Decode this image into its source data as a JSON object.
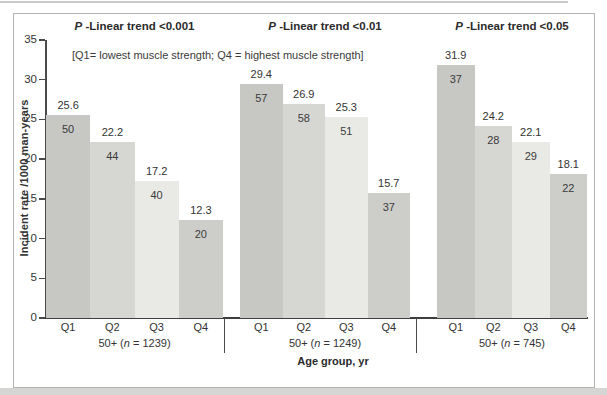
{
  "figure": {
    "subtitle": "[Q1= lowest muscle strength; Q4 = highest muscle strength]"
  },
  "chart_data": {
    "type": "bar",
    "title": "",
    "ylabel": "Incident rate /1000 man-years",
    "xlabel": "Age group, yr",
    "ylim": [
      0,
      35
    ],
    "yticks": [
      0,
      5,
      10,
      15,
      20,
      25,
      30,
      35
    ],
    "grid": false,
    "legend_position": "none",
    "categories": [
      "Q1",
      "Q2",
      "Q3",
      "Q4"
    ],
    "bar_colors": [
      "#c7c8c4",
      "#d6d7d3",
      "#e9eae5",
      "#cdcec9"
    ],
    "annotation": "[Q1= lowest muscle strength; Q4 = highest muscle strength]",
    "panels": [
      {
        "p_prefix": "P",
        "p_trend": " -Linear trend <0.001",
        "group_pre": "50+ (",
        "group_n": "n",
        "group_post": " = 1239)",
        "rates": [
          25.6,
          22.2,
          17.2,
          12.3
        ],
        "counts": [
          50,
          44,
          40,
          20
        ]
      },
      {
        "p_prefix": "P",
        "p_trend": " -Linear trend <0.01",
        "group_pre": "50+ (",
        "group_n": "n",
        "group_post": " = 1249)",
        "rates": [
          29.4,
          26.9,
          25.3,
          15.7
        ],
        "counts": [
          57,
          58,
          51,
          37
        ]
      },
      {
        "p_prefix": "P",
        "p_trend": " -Linear trend <0.05",
        "group_pre": "50+ (",
        "group_n": "n",
        "group_post": " = 745)",
        "rates": [
          31.9,
          24.2,
          22.1,
          18.1
        ],
        "counts": [
          37,
          28,
          29,
          22
        ]
      }
    ]
  }
}
